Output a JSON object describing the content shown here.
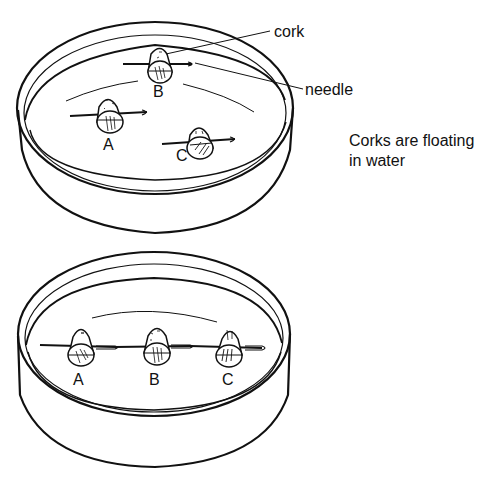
{
  "figure": {
    "top_dish": {
      "labels": {
        "cork": "cork",
        "needle": "needle"
      },
      "corks": [
        {
          "id": "A",
          "label": "A"
        },
        {
          "id": "B",
          "label": "B"
        },
        {
          "id": "C",
          "label": "C"
        }
      ],
      "caption_line1": "Corks are floating",
      "caption_line2": "in water"
    },
    "bottom_dish": {
      "corks": [
        {
          "id": "A",
          "label": "A"
        },
        {
          "id": "B",
          "label": "B"
        },
        {
          "id": "C",
          "label": "C"
        }
      ]
    },
    "colors": {
      "ink": "#111111",
      "background": "#ffffff"
    }
  }
}
